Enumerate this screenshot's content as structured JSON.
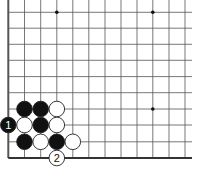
{
  "diagram": {
    "type": "go-board-diagram",
    "board_colors": {
      "background": "#ffffff",
      "line": "#555555",
      "edge": "#333333",
      "black_stone": "#111111",
      "white_stone": "#ffffff",
      "stone_outline": "#222222"
    },
    "grid": {
      "x_lines": [
        8.3,
        24.5,
        40.7,
        56.8,
        72.8,
        88.8,
        105,
        121,
        137,
        152.8,
        169,
        185
      ],
      "y_lines": [
        12.3,
        28.2,
        44.3,
        60.3,
        76.6,
        92.7,
        109,
        125,
        141.8,
        158
      ],
      "left_edge": true,
      "bottom_edge": true,
      "top_edge": false,
      "right_edge": false
    },
    "star_points": [
      {
        "col": 3,
        "row": 0
      },
      {
        "col": 9,
        "row": 0
      },
      {
        "col": 9,
        "row": 6
      }
    ],
    "stones": [
      {
        "color": "black",
        "col": 1,
        "row": 6,
        "label": ""
      },
      {
        "color": "black",
        "col": 2,
        "row": 6,
        "label": ""
      },
      {
        "color": "white",
        "col": 3,
        "row": 6,
        "label": ""
      },
      {
        "color": "black",
        "col": 0,
        "row": 7,
        "label": "1"
      },
      {
        "color": "white",
        "col": 1,
        "row": 7,
        "label": ""
      },
      {
        "color": "black",
        "col": 2,
        "row": 7,
        "label": ""
      },
      {
        "color": "white",
        "col": 3,
        "row": 7,
        "label": ""
      },
      {
        "color": "black",
        "col": 1,
        "row": 8,
        "label": ""
      },
      {
        "color": "white",
        "col": 2,
        "row": 8,
        "label": ""
      },
      {
        "color": "black",
        "col": 3,
        "row": 8,
        "label": ""
      },
      {
        "color": "white",
        "col": 4,
        "row": 8,
        "label": ""
      },
      {
        "color": "white",
        "col": 3,
        "row": 9,
        "label": "2"
      }
    ]
  }
}
